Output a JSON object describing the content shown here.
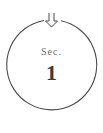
{
  "section": {
    "prefix": "Sec.",
    "number": "1"
  },
  "icons": {
    "top": "double-down-arrow-icon"
  },
  "colors": {
    "stroke": "#4a4a4a",
    "text": "#555555",
    "number": "#3c3c3c",
    "background": "#ffffff"
  }
}
